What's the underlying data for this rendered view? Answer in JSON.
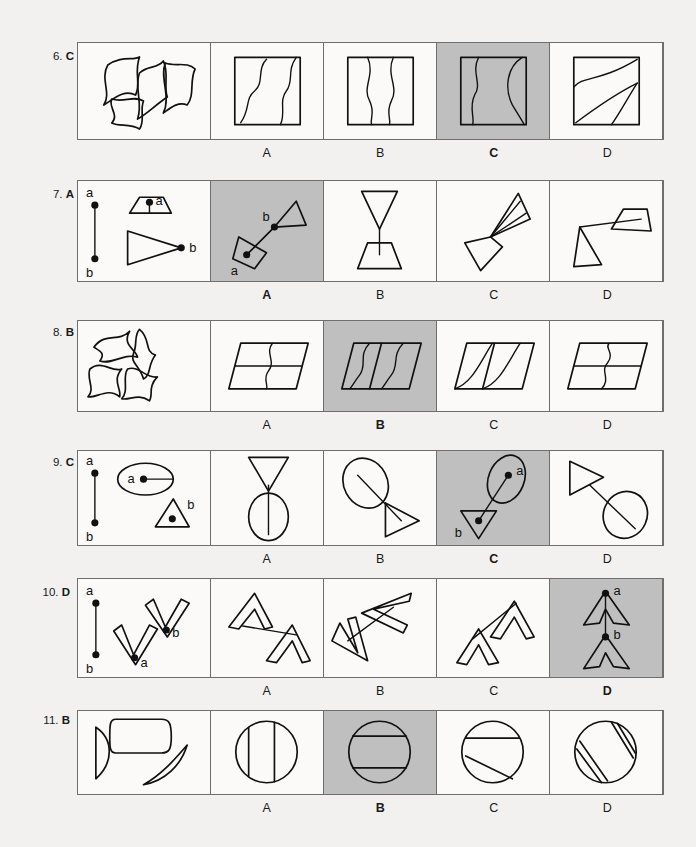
{
  "page": {
    "background": "#f2f1ef",
    "shaded_cell_color": "#bfbfbf",
    "line_color": "#111111",
    "border_color": "#6e6e6e"
  },
  "option_letters": [
    "A",
    "B",
    "C",
    "D"
  ],
  "questions": [
    {
      "number": "6.",
      "answer": "C",
      "correct_index": 2,
      "stem_description": "four curved irregular quadrilateral pieces scattered",
      "options": [
        {
          "letter": "A",
          "shaded": false,
          "description": "square with two vertical wavy lines"
        },
        {
          "letter": "B",
          "shaded": false,
          "description": "square with two symmetric wavy lines forming vase"
        },
        {
          "letter": "C",
          "shaded": true,
          "description": "square with wavy line and a curved diagonal"
        },
        {
          "letter": "D",
          "shaded": false,
          "description": "square with two long diagonals and a small curve"
        }
      ]
    },
    {
      "number": "7.",
      "answer": "A",
      "correct_index": 0,
      "stem_description": "line segment a-b, trapezoid with point a, triangle with point b",
      "stem_labels": [
        "a",
        "b",
        "a",
        "b"
      ],
      "options": [
        {
          "letter": "A",
          "shaded": true,
          "description": "tilted quadrilateral at a joined to narrow triangle at b",
          "labels": [
            "a",
            "b"
          ]
        },
        {
          "letter": "B",
          "shaded": false,
          "description": "inverted triangle above trapezoid joined vertically"
        },
        {
          "letter": "C",
          "shaded": false,
          "description": "quadrilateral joined to narrow triangle diagonally"
        },
        {
          "letter": "D",
          "shaded": false,
          "description": "triangle joined to trapezoid by a line"
        }
      ]
    },
    {
      "number": "8.",
      "answer": "B",
      "correct_index": 1,
      "stem_description": "four S-curved arrow-like polygon pieces scattered",
      "options": [
        {
          "letter": "A",
          "shaded": false,
          "description": "parallelogram with horizontal line and S curve"
        },
        {
          "letter": "B",
          "shaded": true,
          "description": "parallelogram with slanted line and two S curves"
        },
        {
          "letter": "C",
          "shaded": false,
          "description": "parallelogram with slanted line and two shallow curves"
        },
        {
          "letter": "D",
          "shaded": false,
          "description": "parallelogram with horizontal line and reversed S curve"
        }
      ]
    },
    {
      "number": "9.",
      "answer": "C",
      "correct_index": 2,
      "stem_description": "line segment a-b, ellipse with point a, triangle with point b",
      "stem_labels": [
        "a",
        "b",
        "a",
        "b"
      ],
      "options": [
        {
          "letter": "A",
          "shaded": false,
          "description": "inverted triangle above vertical egg shape"
        },
        {
          "letter": "B",
          "shaded": false,
          "description": "ellipse joined to triangle along a diagonal"
        },
        {
          "letter": "C",
          "shaded": true,
          "description": "ellipse with a joined to downward triangle with b",
          "labels": [
            "a",
            "b"
          ]
        },
        {
          "letter": "D",
          "shaded": false,
          "description": "triangle joined to ellipse along a diagonal"
        }
      ]
    },
    {
      "number": "10.",
      "answer": "D",
      "correct_index": 3,
      "stem_description": "line segment a-b, outlined chevron V with point b, outlined chevron V with point a",
      "stem_labels": [
        "a",
        "b",
        "b",
        "a"
      ],
      "options": [
        {
          "letter": "A",
          "shaded": false,
          "description": "two outlined chevrons joined by a long line"
        },
        {
          "letter": "B",
          "shaded": false,
          "description": "two outlined chevrons forming a bent arrow"
        },
        {
          "letter": "C",
          "shaded": false,
          "description": "two outlined chevrons pointing up joined diagonally"
        },
        {
          "letter": "D",
          "shaded": true,
          "description": "two upward outlined chevrons stacked vertically",
          "labels": [
            "a",
            "b"
          ]
        }
      ]
    },
    {
      "number": "11.",
      "answer": "B",
      "correct_index": 1,
      "stem_description": "half disc, rounded rectangle, and crescent segment",
      "options": [
        {
          "letter": "A",
          "shaded": false,
          "description": "circle with two vertical chords"
        },
        {
          "letter": "B",
          "shaded": true,
          "description": "circle with two horizontal chords"
        },
        {
          "letter": "C",
          "shaded": false,
          "description": "circle with a horizontal chord and a slanted chord"
        },
        {
          "letter": "D",
          "shaded": false,
          "description": "circle with two narrow slanted lens chords"
        }
      ]
    }
  ]
}
